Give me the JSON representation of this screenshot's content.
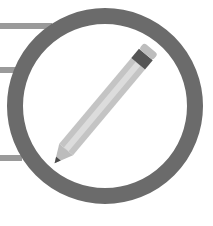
{
  "icon": {
    "name": "no-editing-icon",
    "label": "No editing",
    "colors": {
      "background": "#ffffff",
      "ring": "#6b6b6b",
      "doc_lines": "#9a9a9a",
      "pencil_body": "#c4c4c4",
      "pencil_body_light": "#dcdcdc",
      "pencil_band": "#555555",
      "pencil_eraser": "#bdbdbd",
      "pencil_tip": "#4a4a4a"
    }
  }
}
